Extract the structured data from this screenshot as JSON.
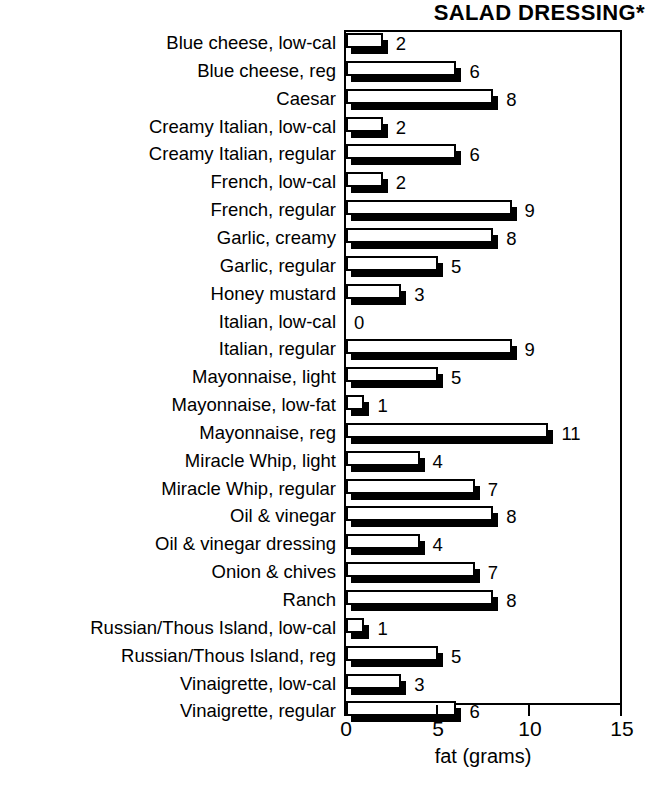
{
  "chart_data": {
    "type": "bar",
    "orientation": "horizontal",
    "title": "SALAD DRESSING*",
    "xlabel": "fat (grams)",
    "ylabel": "",
    "xlim": [
      0,
      15
    ],
    "xticks": [
      0,
      5,
      10,
      15
    ],
    "xtick_labels": [
      "0",
      "5",
      "10",
      "15"
    ],
    "grid": false,
    "legend": null,
    "show_value_labels": true,
    "categories": [
      "Blue cheese, low-cal",
      "Blue cheese, reg",
      "Caesar",
      "Creamy Italian, low-cal",
      "Creamy Italian, regular",
      "French, low-cal",
      "French, regular",
      "Garlic, creamy",
      "Garlic, regular",
      "Honey mustard",
      "Italian, low-cal",
      "Italian, regular",
      "Mayonnaise, light",
      "Mayonnaise, low-fat",
      "Mayonnaise, reg",
      "Miracle Whip, light",
      "Miracle Whip, regular",
      "Oil & vinegar",
      "Oil & vinegar dressing",
      "Onion & chives",
      "Ranch",
      "Russian/Thous Island, low-cal",
      "Russian/Thous Island, reg",
      "Vinaigrette, low-cal",
      "Vinaigrette, regular"
    ],
    "values": [
      2,
      6,
      8,
      2,
      6,
      2,
      9,
      8,
      5,
      3,
      0,
      9,
      5,
      1,
      11,
      4,
      7,
      8,
      4,
      7,
      8,
      1,
      5,
      3,
      6
    ],
    "value_labels": [
      "2",
      "6",
      "8",
      "2",
      "6",
      "2",
      "9",
      "8",
      "5",
      "3",
      "0",
      "9",
      "5",
      "1",
      "11",
      "4",
      "7",
      "8",
      "4",
      "7",
      "8",
      "1",
      "5",
      "3",
      "6"
    ]
  },
  "style": {
    "bar_face_color": "#ffffff",
    "bar_edge_color": "#000000",
    "bar_shadow_color": "#000000",
    "background_color": "#ffffff",
    "text_color": "#000000"
  }
}
